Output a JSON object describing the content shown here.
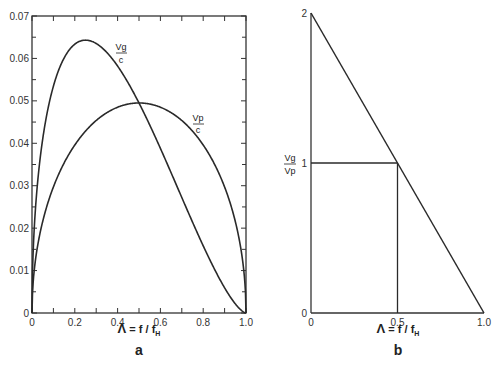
{
  "chart_data": [
    {
      "panel": "a",
      "type": "line",
      "title": "",
      "xlabel": "Λ = f/f_H",
      "ylabel": "",
      "xlim": [
        0,
        1.0
      ],
      "ylim": [
        0,
        0.07
      ],
      "grid": false,
      "x_ticks": [
        "0",
        "0.2",
        "0.4",
        "0.6",
        "0.8",
        "1.0"
      ],
      "y_ticks": [
        "0",
        "0.01",
        "0.02",
        "0.03",
        "0.04",
        "0.05",
        "0.06",
        "0.07"
      ],
      "x": [
        0,
        0.05,
        0.1,
        0.15,
        0.2,
        0.25,
        0.3,
        0.35,
        0.4,
        0.45,
        0.5,
        0.55,
        0.6,
        0.65,
        0.7,
        0.75,
        0.8,
        0.85,
        0.9,
        0.95,
        1.0
      ],
      "series": [
        {
          "name": "Vg/c",
          "label_top": "Vg",
          "label_bottom": "c",
          "values": [
            0,
            0.0366,
            0.0505,
            0.0582,
            0.0626,
            0.0643,
            0.064,
            0.0621,
            0.0588,
            0.0543,
            0.0495,
            0.0442,
            0.0388,
            0.0332,
            0.0277,
            0.0214,
            0.0158,
            0.0106,
            0.0059,
            0.0022,
            0
          ]
        },
        {
          "name": "Vp/c",
          "label_top": "Vp",
          "label_bottom": "c",
          "values": [
            0,
            0.0216,
            0.0297,
            0.0353,
            0.0396,
            0.0429,
            0.0454,
            0.0472,
            0.0485,
            0.0493,
            0.0495,
            0.0493,
            0.0485,
            0.0472,
            0.0454,
            0.0429,
            0.0396,
            0.0353,
            0.0297,
            0.0216,
            0
          ]
        }
      ],
      "annotations": [
        "Vg/c",
        "Vp/c"
      ]
    },
    {
      "panel": "b",
      "type": "line",
      "title": "",
      "xlabel": "Λ = f/f_H",
      "ylabel": "Vg/Vp",
      "xlim": [
        0,
        1.0
      ],
      "ylim": [
        0,
        2
      ],
      "grid": false,
      "x_ticks": [
        "0",
        "0.5",
        "1.0"
      ],
      "y_ticks": [
        "0",
        "1",
        "2"
      ],
      "series": [
        {
          "name": "Vg/Vp",
          "x": [
            0,
            1.0
          ],
          "values": [
            2,
            0
          ]
        }
      ],
      "reference_lines": [
        {
          "type": "horizontal",
          "y": 1,
          "x_from": 0,
          "x_to": 0.5
        },
        {
          "type": "vertical",
          "x": 0.5,
          "y_from": 0,
          "y_to": 1
        }
      ]
    }
  ],
  "panels": {
    "a": {
      "label": "a",
      "xlabel_lambda": "Λ",
      "xlabel_rest": " = f / f",
      "xlabel_sub": "H",
      "curve1_top": "Vg",
      "curve1_bottom": "c",
      "curve2_top": "Vp",
      "curve2_bottom": "c"
    },
    "b": {
      "label": "b",
      "xlabel_lambda": "Λ",
      "xlabel_rest": " = f / f",
      "xlabel_sub": "H",
      "ylabel_top": "Vg",
      "ylabel_bottom": "Vp"
    }
  }
}
